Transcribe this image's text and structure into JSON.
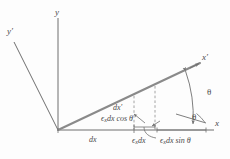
{
  "figure": {
    "background_color": "#fdfdfd",
    "line_color": "#6f6f6f",
    "heavy_line_color": "#808080",
    "text_color": "#4a4a4a",
    "dash_color": "#9a9a9a"
  },
  "axes": {
    "y_label": "y",
    "y_prime_label": "y′",
    "x_label": "x",
    "x_prime_label": "x′",
    "origin": {
      "x": 58,
      "y": 130
    },
    "y_tip": {
      "x": 58,
      "y": 18
    },
    "y_prime_tip": {
      "x": 14,
      "y": 42
    },
    "x_tip": {
      "x": 214,
      "y": 130
    },
    "x_prime_tip": {
      "x": 200,
      "y": 63
    }
  },
  "labels": {
    "dx": "dx",
    "dx_prime": "dx′",
    "eps_dx": "ϵ",
    "eps_dx_sub": "x",
    "eps_dx_rest": "dx",
    "eps_dx_cos": "ϵ",
    "eps_dx_cos_sub": "x",
    "eps_dx_cos_rest": "dx cos θ",
    "eps_dx_sin": "ϵ",
    "eps_dx_sin_sub": "x",
    "eps_dx_sin_rest": "dx sin θ",
    "theta_upper": "θ",
    "theta_lower": "θ"
  },
  "geometry": {
    "rotation_angle_deg": 23,
    "arc_outer_radius": 100,
    "arc_inner_radius": 36
  }
}
